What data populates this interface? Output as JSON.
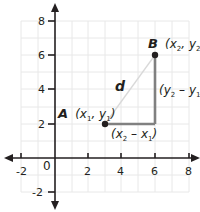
{
  "diagram": {
    "axes": {
      "x_ticks": [
        "-2",
        "2",
        "4",
        "6",
        "8"
      ],
      "y_ticks": [
        "8",
        "6",
        "4",
        "2",
        "-2"
      ],
      "origin_label": "0",
      "x_range": [
        -2,
        8
      ],
      "y_range": [
        -2,
        8
      ]
    },
    "points": {
      "A": {
        "letter": "A",
        "coords_label": "(x",
        "x_sub": "1",
        "sep": ", y",
        "y_sub": "1",
        "close": ")",
        "x": 3,
        "y": 2
      },
      "B": {
        "letter": "B",
        "coords_label": "(x",
        "x_sub": "2",
        "sep": ", y",
        "y_sub": "2",
        "close": ")",
        "x": 6,
        "y": 6
      }
    },
    "labels": {
      "distance": "d",
      "horizontal_leg": {
        "open": "(x",
        "sub_a": "2",
        "minus": " – x",
        "sub_b": "1",
        "close": ")"
      },
      "vertical_leg": {
        "open": "(y",
        "sub_a": "2",
        "minus": " – y",
        "sub_b": "1",
        "close": ")"
      }
    },
    "colors": {
      "axis": "#231f20",
      "grid": "#e6e6e6",
      "legs": "#808080",
      "hypotenuse": "#d9d9d9",
      "point": "#231f20"
    }
  }
}
